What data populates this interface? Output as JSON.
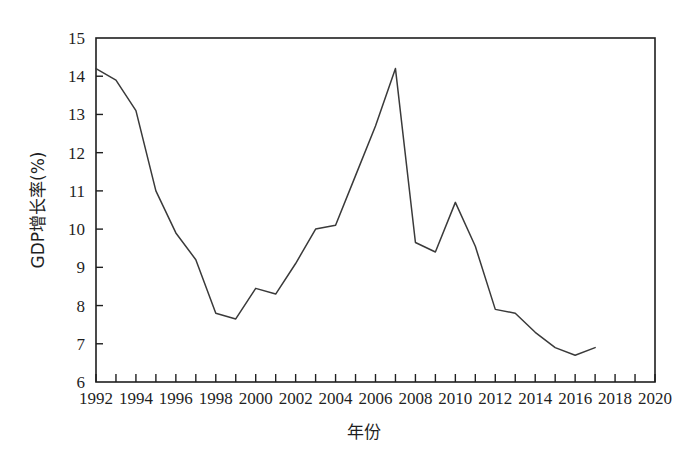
{
  "figure": {
    "background_color": "#ffffff",
    "line_color": "#3a3a3a",
    "axis_color": "#1f1f1f"
  },
  "chart_data": {
    "type": "line",
    "title": "",
    "subtitle": "",
    "xlabel": "年份",
    "ylabel": "GDP增长率(%)",
    "xlim": [
      1992,
      2020
    ],
    "ylim": [
      6,
      15
    ],
    "xticks": [
      1992,
      1994,
      1996,
      1998,
      2000,
      2002,
      2004,
      2006,
      2008,
      2010,
      2012,
      2014,
      2016,
      2018,
      2020
    ],
    "xtick_labels": [
      "1992",
      "1994",
      "1996",
      "1998",
      "2000",
      "2002",
      "2004",
      "2006",
      "2008",
      "2010",
      "2012",
      "2014",
      "2016",
      "2018",
      "2020"
    ],
    "xticks_minor": [
      1993,
      1995,
      1997,
      1999,
      2001,
      2003,
      2005,
      2007,
      2009,
      2011,
      2013,
      2015,
      2017,
      2019
    ],
    "yticks": [
      6,
      7,
      8,
      9,
      10,
      11,
      12,
      13,
      14,
      15
    ],
    "ytick_labels": [
      "6",
      "7",
      "8",
      "9",
      "10",
      "11",
      "12",
      "13",
      "14",
      "15"
    ],
    "grid": false,
    "legend": false,
    "legend_position": "none",
    "series": [
      {
        "name": "GDP增长率",
        "x": [
          1992,
          1993,
          1994,
          1995,
          1996,
          1997,
          1998,
          1999,
          2000,
          2001,
          2002,
          2003,
          2004,
          2005,
          2006,
          2007,
          2008,
          2009,
          2010,
          2011,
          2012,
          2013,
          2014,
          2015,
          2016,
          2017
        ],
        "values": [
          14.2,
          13.9,
          13.1,
          11.0,
          9.9,
          9.2,
          7.8,
          7.65,
          8.45,
          8.3,
          9.1,
          10.0,
          10.1,
          11.4,
          12.7,
          14.2,
          9.65,
          9.4,
          10.7,
          9.55,
          7.9,
          7.8,
          7.3,
          6.9,
          6.7,
          6.9
        ]
      }
    ]
  },
  "axes": {
    "x_axis_label": "年份",
    "y_axis_label": "GDP增长率(%)"
  }
}
